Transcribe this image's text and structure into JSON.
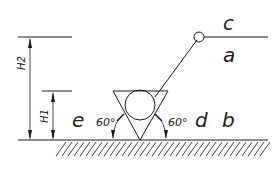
{
  "diagram": {
    "type": "welding-symbol-engineering-drawing",
    "labels": {
      "c": "c",
      "a": "a",
      "e": "e",
      "d": "d",
      "b": "b",
      "h1": "H1",
      "h2": "H2",
      "angle_left": "60°",
      "angle_right": "60°"
    },
    "elements": [
      "ground-line-with-hatching",
      "inverted-triangle",
      "inscribed-circle",
      "leader-line-with-circle",
      "reference-line",
      "dimension-H1",
      "dimension-H2",
      "angle-annotations"
    ]
  }
}
